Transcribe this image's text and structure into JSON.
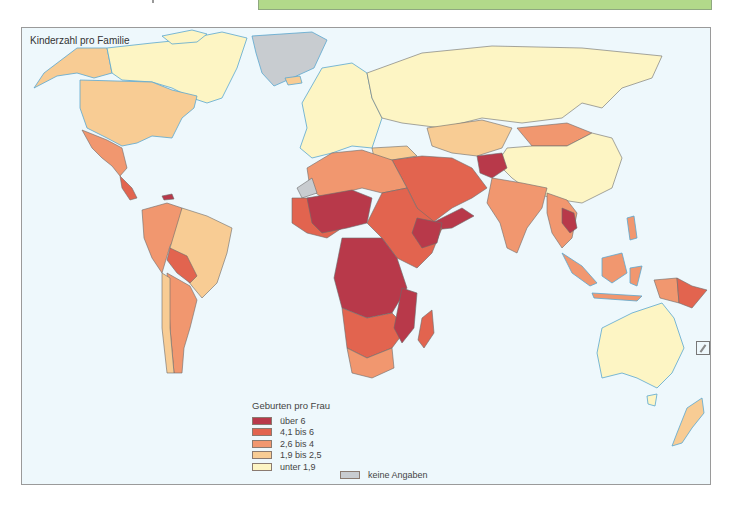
{
  "header": {
    "green_box_label": ""
  },
  "map": {
    "title": "Kinderzahl pro Familie",
    "background_color": "#eef8fc",
    "coast_color": "#5aa7cf"
  },
  "legend": {
    "title": "Geburten pro Frau",
    "items": [
      {
        "label": "über 6",
        "color": "#b8394a"
      },
      {
        "label": "4,1 bis 6",
        "color": "#e2644f"
      },
      {
        "label": "2,6 bis 4",
        "color": "#f1976f"
      },
      {
        "label": "1,9 bis 2,5",
        "color": "#f8cc94"
      },
      {
        "label": "unter 1,9",
        "color": "#fdf5c4"
      }
    ],
    "no_data": {
      "label": "keine Angaben",
      "color": "#c8ccd0"
    }
  },
  "regions": {
    "north_america": {
      "canada": "unter 1,9",
      "usa": "1,9 bis 2,5",
      "alaska": "1,9 bis 2,5",
      "mexico": "2,6 bis 4",
      "central_america": "4,1 bis 6"
    },
    "greenland": "keine Angaben",
    "south_america": {
      "brazil": "1,9 bis 2,5",
      "bolivia_paraguay": "4,1 bis 6",
      "argentina": "2,6 bis 4",
      "chile": "1,9 bis 2,5",
      "andean": "2,6 bis 4"
    },
    "europe": "unter 1,9",
    "russia": "unter 1,9",
    "china": "unter 1,9",
    "mongolia_kazakhstan": "2,6 bis 4",
    "middle_east": "4,1 bis 6",
    "afghanistan_yemen": "über 6",
    "india": "2,6 bis 4",
    "africa": {
      "sahel_central": "über 6",
      "north_africa": "2,6 bis 4",
      "rest": "4,1 bis 6",
      "south_africa": "2,6 bis 4",
      "western_sahara": "keine Angaben"
    },
    "southeast_asia": "2,6 bis 4",
    "papua_new_guinea": "4,1 bis 6",
    "australia": "unter 1,9",
    "new_zealand": "1,9 bis 2,5"
  }
}
